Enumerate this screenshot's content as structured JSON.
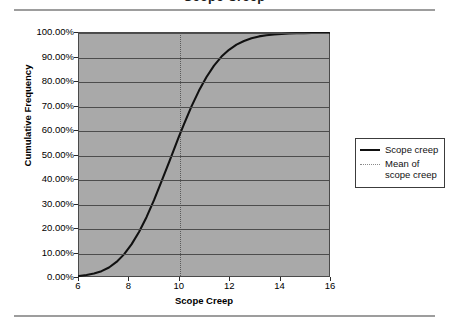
{
  "page": {
    "title_fragment": "Scope Creep"
  },
  "chart_data": {
    "type": "line",
    "title": "Scope Creep",
    "xlabel": "Scope Creep",
    "ylabel": "Cumulative Frequency",
    "xlim": [
      6,
      16
    ],
    "ylim": [
      0,
      1
    ],
    "grid": true,
    "legend_position": "right",
    "x_ticks": [
      "6",
      "8",
      "10",
      "12",
      "14",
      "16"
    ],
    "x_tick_values": [
      6,
      8,
      10,
      12,
      14,
      16
    ],
    "y_ticks": [
      "0.00%",
      "10.00%",
      "20.00%",
      "30.00%",
      "40.00%",
      "50.00%",
      "60.00%",
      "70.00%",
      "80.00%",
      "90.00%",
      "100.00%"
    ],
    "y_tick_values": [
      0,
      0.1,
      0.2,
      0.3,
      0.4,
      0.5,
      0.6,
      0.7,
      0.8,
      0.9,
      1.0
    ],
    "series": [
      {
        "name": "Scope creep",
        "style": "solid",
        "color": "#111111",
        "x": [
          6.0,
          6.3,
          6.6,
          6.9,
          7.2,
          7.5,
          7.8,
          8.1,
          8.4,
          8.7,
          9.0,
          9.3,
          9.6,
          9.9,
          10.0,
          10.2,
          10.5,
          10.8,
          11.1,
          11.4,
          11.7,
          12.0,
          12.3,
          12.6,
          12.9,
          13.2,
          13.5,
          13.8,
          14.1,
          14.4,
          14.7,
          15.0,
          15.3,
          15.6,
          16.0
        ],
        "values": [
          0.0,
          0.004,
          0.01,
          0.02,
          0.035,
          0.058,
          0.089,
          0.13,
          0.181,
          0.242,
          0.312,
          0.389,
          0.468,
          0.548,
          0.575,
          0.625,
          0.698,
          0.763,
          0.819,
          0.866,
          0.903,
          0.931,
          0.952,
          0.967,
          0.978,
          0.986,
          0.991,
          0.994,
          0.996,
          0.998,
          0.999,
          0.999,
          1.0,
          1.0,
          1.0
        ]
      },
      {
        "name": "Mean of scope creep",
        "style": "dotted",
        "color": "#5a5a5a",
        "type": "vertical-line",
        "x_value": 10
      }
    ],
    "legend": [
      {
        "label": "Scope creep",
        "style": "solid"
      },
      {
        "label": "Mean of\nscope creep",
        "style": "dotted",
        "line1": "Mean of",
        "line2": "scope creep"
      }
    ],
    "colors": {
      "plot_background": "#a9a9a9",
      "gridline": "#4d4d4d",
      "axis": "#2b2b2b",
      "curve": "#111111",
      "mean_line": "#5a5a5a",
      "page_rule": "#9d9d9d"
    }
  }
}
